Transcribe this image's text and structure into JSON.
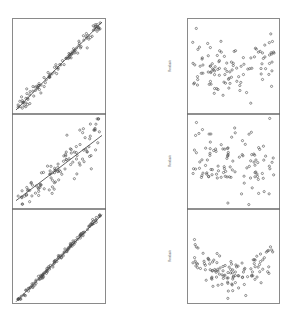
{
  "chart_data": [
    {
      "type": "scatter",
      "panel": "left-top",
      "title": "",
      "xlabel": "",
      "ylabel": "",
      "pattern": "tight linear relationship with fitted line",
      "fit_line": {
        "intercept": 0.0,
        "slope": 1.0
      },
      "n_points": 110,
      "noise_sd": 0.035,
      "curvature": 0.0,
      "xlim": [
        0,
        1
      ],
      "ylim": [
        0,
        1
      ],
      "grid": false,
      "legend": "none"
    },
    {
      "type": "scatter",
      "panel": "left-middle",
      "title": "",
      "xlabel": "",
      "ylabel": "",
      "pattern": "linear relationship with increasing spread and fitted line",
      "fit_line": {
        "intercept": 0.05,
        "slope": 0.75
      },
      "n_points": 110,
      "noise_sd": 0.09,
      "curvature": 0.25,
      "xlim": [
        0,
        1
      ],
      "ylim": [
        0,
        1
      ],
      "grid": false,
      "legend": "none"
    },
    {
      "type": "scatter",
      "panel": "left-bottom",
      "title": "",
      "xlabel": "",
      "ylabel": "",
      "pattern": "very tight, slightly convex relationship with fitted line",
      "fit_line": {
        "intercept": -0.02,
        "slope": 1.0
      },
      "n_points": 130,
      "noise_sd": 0.018,
      "curvature": 0.12,
      "xlim": [
        0,
        1
      ],
      "ylim": [
        0,
        1
      ],
      "grid": false,
      "legend": "none"
    },
    {
      "type": "scatter",
      "panel": "right-top",
      "title": "",
      "xlabel": "",
      "ylabel": "Residuals",
      "pattern": "random scatter around zero",
      "n_points": 110,
      "shape": "flat",
      "xlim": [
        0,
        1
      ],
      "ylim": [
        -1,
        1
      ],
      "grid": false,
      "legend": "none"
    },
    {
      "type": "scatter",
      "panel": "right-middle",
      "title": "",
      "xlabel": "",
      "ylabel": "Residuals",
      "pattern": "random scatter around zero",
      "n_points": 110,
      "shape": "flat",
      "xlim": [
        0,
        1
      ],
      "ylim": [
        -1,
        1
      ],
      "grid": false,
      "legend": "none"
    },
    {
      "type": "scatter",
      "panel": "right-bottom",
      "title": "",
      "xlabel": "",
      "ylabel": "Residuals",
      "pattern": "U-shaped residual curve",
      "n_points": 120,
      "shape": "u",
      "xlim": [
        0,
        1
      ],
      "ylim": [
        -1,
        1
      ],
      "grid": false,
      "legend": "none"
    }
  ],
  "colors": {
    "points": "#4a4a4a",
    "frame": "#8a8a8a",
    "line": "#3a3a3a"
  }
}
